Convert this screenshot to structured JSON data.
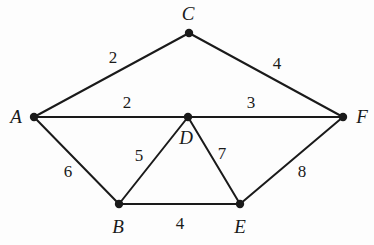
{
  "figure": {
    "kind": "weighted-undirected-graph",
    "background_color": "#fdfdfd",
    "stroke_color": "#1a1a1a",
    "width": 374,
    "height": 245
  },
  "graph_data": {
    "type": "graph",
    "directed": false,
    "weighted": true,
    "nodes": [
      {
        "id": "A",
        "label": "A",
        "x": 34,
        "y": 117,
        "label_x": 16,
        "label_y": 116
      },
      {
        "id": "B",
        "label": "B",
        "x": 119,
        "y": 204,
        "label_x": 118,
        "label_y": 226
      },
      {
        "id": "C",
        "label": "C",
        "x": 189,
        "y": 33,
        "label_x": 188,
        "label_y": 13
      },
      {
        "id": "D",
        "label": "D",
        "x": 188,
        "y": 117,
        "label_x": 186,
        "label_y": 137
      },
      {
        "id": "E",
        "label": "E",
        "x": 240,
        "y": 204,
        "label_x": 240,
        "label_y": 226
      },
      {
        "id": "F",
        "label": "F",
        "x": 343,
        "y": 117,
        "label_x": 362,
        "label_y": 116
      }
    ],
    "edges": [
      {
        "id": "A-C",
        "source": "A",
        "target": "C",
        "weight": 2,
        "label": "2",
        "label_x": 113,
        "label_y": 57
      },
      {
        "id": "C-F",
        "source": "C",
        "target": "F",
        "weight": 4,
        "label": "4",
        "label_x": 277,
        "label_y": 63
      },
      {
        "id": "A-D",
        "source": "A",
        "target": "D",
        "weight": 2,
        "label": "2",
        "label_x": 127,
        "label_y": 102
      },
      {
        "id": "D-F",
        "source": "D",
        "target": "F",
        "weight": 3,
        "label": "3",
        "label_x": 251,
        "label_y": 102
      },
      {
        "id": "A-B",
        "source": "A",
        "target": "B",
        "weight": 6,
        "label": "6",
        "label_x": 68,
        "label_y": 171
      },
      {
        "id": "B-D",
        "source": "B",
        "target": "D",
        "weight": 5,
        "label": "5",
        "label_x": 139,
        "label_y": 155
      },
      {
        "id": "D-E",
        "source": "D",
        "target": "E",
        "weight": 7,
        "label": "7",
        "label_x": 222,
        "label_y": 153
      },
      {
        "id": "E-F",
        "source": "E",
        "target": "F",
        "weight": 8,
        "label": "8",
        "label_x": 302,
        "label_y": 171
      },
      {
        "id": "B-E",
        "source": "B",
        "target": "E",
        "weight": 4,
        "label": "4",
        "label_x": 180,
        "label_y": 223
      }
    ]
  }
}
